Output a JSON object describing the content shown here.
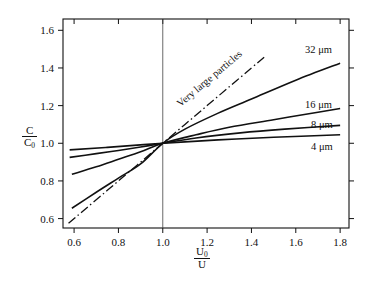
{
  "chart_data": {
    "type": "line",
    "title": "",
    "xlabel": "U0/U",
    "ylabel": "C/C0",
    "xlim": [
      0.55,
      1.84
    ],
    "ylim": [
      0.55,
      1.66
    ],
    "grid": false,
    "legend": "inline-right-end-labels",
    "xticks": [
      0.6,
      0.8,
      1.0,
      1.2,
      1.4,
      1.6,
      1.8
    ],
    "yticks": [
      0.6,
      0.8,
      1.0,
      1.2,
      1.4,
      1.6
    ],
    "xticklabels": [
      "0.6",
      "0.8",
      "1.0",
      "1.2",
      "1.4",
      "1.6",
      "1.8"
    ],
    "yticklabels": [
      "0.6",
      "0.8",
      "1.0",
      "1.2",
      "1.4",
      "1.6"
    ],
    "reference_lines": [
      {
        "name": "unity-vertical",
        "x": 1.0,
        "style": "thin-solid"
      }
    ],
    "annotations": [
      {
        "text": "Very large particles",
        "x": 1.22,
        "y": 1.33,
        "rotation": -40
      }
    ],
    "series": [
      {
        "name": "Very large particles",
        "label": "Very large particles",
        "style": "dash-dot",
        "x": [
          0.575,
          0.65,
          0.75,
          0.85,
          0.95,
          1.0,
          1.1,
          1.2,
          1.3,
          1.4,
          1.46
        ],
        "values": [
          0.575,
          0.65,
          0.75,
          0.85,
          0.95,
          1.0,
          1.1,
          1.2,
          1.3,
          1.4,
          1.46
        ]
      },
      {
        "name": "32 um",
        "label": "32 μm",
        "style": "solid",
        "x": [
          0.59,
          0.7,
          0.8,
          0.9,
          1.0,
          1.1,
          1.25,
          1.4,
          1.6,
          1.8
        ],
        "values": [
          0.655,
          0.74,
          0.815,
          0.89,
          1.0,
          1.075,
          1.16,
          1.235,
          1.335,
          1.425
        ]
      },
      {
        "name": "16 um",
        "label": "16 μm",
        "style": "solid",
        "x": [
          0.59,
          0.7,
          0.8,
          0.9,
          1.0,
          1.15,
          1.3,
          1.5,
          1.7,
          1.8
        ],
        "values": [
          0.835,
          0.875,
          0.915,
          0.955,
          1.0,
          1.045,
          1.085,
          1.125,
          1.165,
          1.185
        ]
      },
      {
        "name": "8 um",
        "label": "8 μm",
        "style": "solid",
        "x": [
          0.58,
          0.7,
          0.8,
          0.9,
          1.0,
          1.15,
          1.35,
          1.55,
          1.8
        ],
        "values": [
          0.925,
          0.945,
          0.962,
          0.98,
          1.0,
          1.028,
          1.055,
          1.075,
          1.095
        ]
      },
      {
        "name": "4 um",
        "label": "4 μm",
        "style": "solid",
        "x": [
          0.58,
          0.75,
          1.0,
          1.25,
          1.5,
          1.8
        ],
        "values": [
          0.965,
          0.978,
          1.0,
          1.018,
          1.032,
          1.045
        ]
      }
    ]
  },
  "axis": {
    "y_label_num": "C",
    "y_label_den": "C",
    "y_label_den_sub": "0",
    "x_label_num": "U",
    "x_label_num_sub": "0",
    "x_label_den": "U"
  },
  "colors": {
    "line": "#111111",
    "frame": "#111111",
    "background": "#ffffff"
  }
}
